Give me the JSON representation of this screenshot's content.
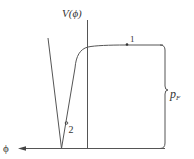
{
  "diagram": {
    "type": "potential-energy-curve",
    "y_axis_label": "V(ϕ)",
    "x_axis_label": "ϕ",
    "points": [
      {
        "id": "1",
        "label": "1",
        "x": 127,
        "y": 44.5
      },
      {
        "id": "2",
        "label": "2",
        "x": 66.5,
        "y": 123
      }
    ],
    "brace_label_main": "p",
    "brace_label_sub": "F",
    "colors": {
      "line": "#555555",
      "text": "#333333",
      "background": "#ffffff"
    }
  }
}
